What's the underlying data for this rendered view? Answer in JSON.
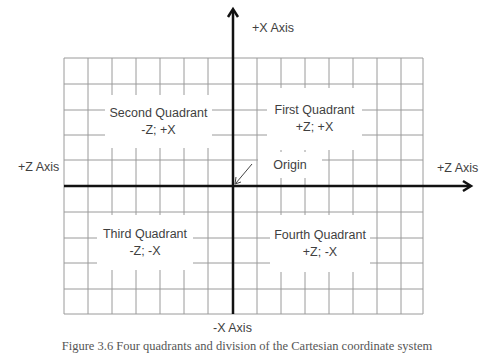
{
  "diagram": {
    "grid": {
      "left": 64,
      "top": 58,
      "right": 423,
      "bottom": 314,
      "vlines": [
        64,
        88,
        112,
        136,
        160,
        184,
        208,
        257,
        281,
        305,
        329,
        353,
        377,
        401,
        423
      ],
      "hlines": [
        58,
        84,
        110,
        135,
        160,
        212,
        238,
        263,
        289,
        314
      ],
      "line_color": "#9a9a9a",
      "axis_color": "#111111"
    },
    "axes": {
      "vertical": {
        "x": 233,
        "top": 8,
        "bottom": 314
      },
      "horizontal": {
        "y": 186,
        "left": 64,
        "right": 470
      }
    },
    "labels": {
      "x_pos": "+X Axis",
      "x_neg": "-X Axis",
      "z_left": "+Z Axis",
      "z_right": "+Z Axis",
      "origin": "Origin"
    },
    "quadrants": [
      {
        "name": "Second Quadrant",
        "signs": "-Z; +X"
      },
      {
        "name": "First Quadrant",
        "signs": "+Z; +X"
      },
      {
        "name": "Third Quadrant",
        "signs": "-Z; -X"
      },
      {
        "name": "Fourth Quadrant",
        "signs": "+Z; -X"
      }
    ],
    "caption": "Figure 3.6 Four quadrants and division of the Cartesian coordinate system"
  }
}
